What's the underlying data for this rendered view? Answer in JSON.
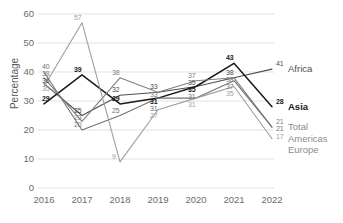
{
  "chart_data": {
    "type": "line",
    "title": "",
    "xlabel": "",
    "ylabel": "Percentage",
    "categories": [
      "2016",
      "2017",
      "2018",
      "2019",
      "2020",
      "2021",
      "2022"
    ],
    "ylim": [
      0,
      60
    ],
    "yticks": [
      "0",
      "10",
      "20",
      "30",
      "40",
      "50",
      "60"
    ],
    "grid": "horizontal",
    "legend_position": "right-edge-labels",
    "series": [
      {
        "name": "Africa",
        "color": "#4d4d4d",
        "bold_labels": false,
        "values": [
          36,
          25,
          32,
          33,
          35,
          38,
          41
        ]
      },
      {
        "name": "Asia",
        "color": "#1a1a1a",
        "bold_labels": true,
        "values": [
          29,
          39,
          29,
          31,
          35,
          43,
          28
        ]
      },
      {
        "name": "Total",
        "color": "#808080",
        "bold_labels": false,
        "values": [
          38,
          23,
          38,
          33,
          37,
          38,
          21
        ]
      },
      {
        "name": "Americas",
        "color": "#737373",
        "bold_labels": false,
        "values": [
          40,
          20,
          25,
          31,
          31,
          37,
          21
        ]
      },
      {
        "name": "Europe",
        "color": "#9e9e9e",
        "bold_labels": false,
        "values": [
          35,
          57,
          9,
          27,
          31,
          35,
          17
        ]
      }
    ],
    "data_labels": {
      "2016": [
        "40",
        "38",
        "36",
        "35",
        "29"
      ],
      "2017": [
        "57",
        "39",
        "25",
        "23",
        "20"
      ],
      "2018": [
        "38",
        "32",
        "29",
        "25",
        "9"
      ],
      "2019": [
        "33",
        "33",
        "31",
        "31",
        "27"
      ],
      "2020": [
        "37",
        "35",
        "35",
        "31",
        "31"
      ],
      "2021": [
        "43",
        "38",
        "38",
        "37",
        "35"
      ],
      "2022": [
        "41",
        "28",
        "21",
        "21",
        "17"
      ]
    }
  },
  "series_labels": [
    {
      "text": "Africa",
      "color": "#4d4d4d"
    },
    {
      "text": "Asia",
      "color": "#1a1a1a"
    },
    {
      "text": "Total",
      "color": "#8c8c8c"
    },
    {
      "text": "Americas",
      "color": "#8c8c8c"
    },
    {
      "text": "Europe",
      "color": "#8c8c8c"
    }
  ]
}
